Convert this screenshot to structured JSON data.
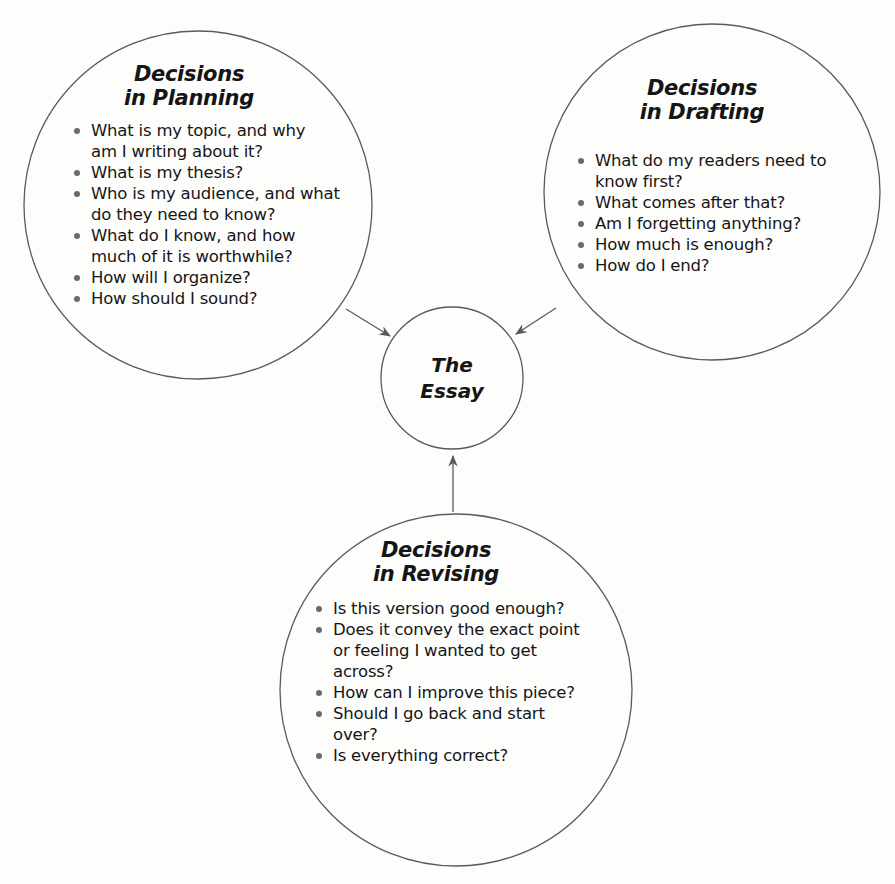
{
  "diagram": {
    "center": {
      "title_line1": "The",
      "title_line2": "Essay"
    },
    "planning": {
      "title_line1": "Decisions",
      "title_line2": "in Planning",
      "questions": [
        "What is my topic, and why am I writing about it?",
        "What is my thesis?",
        "Who is my audience, and what do they need to know?",
        "What do I know, and how much of it is worthwhile?",
        "How will I organize?",
        "How should I sound?"
      ]
    },
    "drafting": {
      "title_line1": "Decisions",
      "title_line2": "in Drafting",
      "questions": [
        "What do my readers need to know first?",
        "What comes after that?",
        "Am I forgetting anything?",
        "How much is enough?",
        "How do I end?"
      ]
    },
    "revising": {
      "title_line1": "Decisions",
      "title_line2": "in Revising",
      "questions": [
        "Is this version good enough?",
        "Does it convey the exact point or feeling I wanted to get across?",
        "How can I improve this piece?",
        "Should I go back and start over?",
        "Is everything correct?"
      ]
    },
    "colors": {
      "stroke": "#5a5a5a",
      "text": "#151515",
      "bullet": "#6a6a6a",
      "background": "#fdfdfc"
    }
  }
}
